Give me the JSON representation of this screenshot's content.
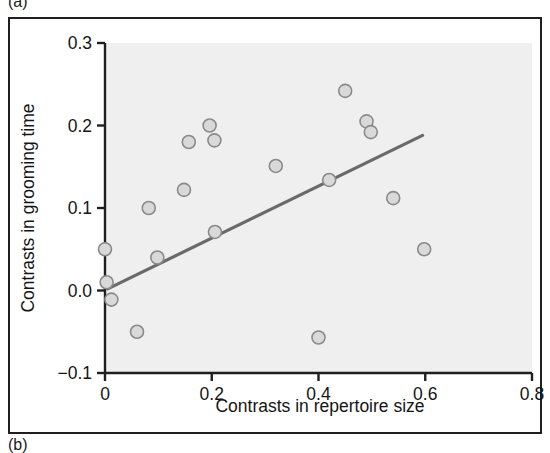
{
  "figure": {
    "panels": [
      {
        "id": "a",
        "label": "(a)"
      },
      {
        "id": "b",
        "label": "(b)"
      }
    ]
  },
  "chart_data": {
    "type": "scatter",
    "title": "",
    "xlabel": "Contrasts in repertoire size",
    "ylabel": "Contrasts in grooming time",
    "xlim": [
      0,
      0.8
    ],
    "ylim": [
      -0.1,
      0.3
    ],
    "xticks": [
      0,
      0.2,
      0.4,
      0.6,
      0.8
    ],
    "xtick_labels": [
      "0",
      "0.2",
      "0.4",
      "0.6",
      "0.8"
    ],
    "yticks": [
      -0.1,
      0.0,
      0.1,
      0.2,
      0.3
    ],
    "ytick_labels": [
      "−0.1",
      "0.0",
      "0.1",
      "0.2",
      "0.3"
    ],
    "grid": false,
    "legend": false,
    "plot_background": "#efefef",
    "marker": {
      "shape": "circle",
      "fill": "#d9d9d9",
      "edge": "#8a8a8a",
      "radius": 6.5
    },
    "points": [
      {
        "x": 0.0,
        "y": 0.05
      },
      {
        "x": 0.003,
        "y": 0.01
      },
      {
        "x": 0.012,
        "y": -0.011
      },
      {
        "x": 0.06,
        "y": -0.05
      },
      {
        "x": 0.082,
        "y": 0.1
      },
      {
        "x": 0.098,
        "y": 0.04
      },
      {
        "x": 0.148,
        "y": 0.122
      },
      {
        "x": 0.157,
        "y": 0.18
      },
      {
        "x": 0.196,
        "y": 0.2
      },
      {
        "x": 0.205,
        "y": 0.182
      },
      {
        "x": 0.206,
        "y": 0.071
      },
      {
        "x": 0.32,
        "y": 0.151
      },
      {
        "x": 0.4,
        "y": -0.057
      },
      {
        "x": 0.42,
        "y": 0.134
      },
      {
        "x": 0.45,
        "y": 0.242
      },
      {
        "x": 0.49,
        "y": 0.205
      },
      {
        "x": 0.498,
        "y": 0.192
      },
      {
        "x": 0.54,
        "y": 0.112
      },
      {
        "x": 0.598,
        "y": 0.05
      }
    ],
    "trendline": {
      "type": "linear",
      "color": "#6a6a6a",
      "width": 3.2,
      "x_start": 0.005,
      "y_start": 0.002,
      "x_end": 0.595,
      "y_end": 0.188
    }
  }
}
